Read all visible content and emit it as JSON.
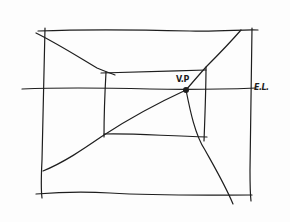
{
  "diagram": {
    "type": "one-point-perspective-sketch",
    "colors": {
      "ink": "#1e1e1e",
      "paper": "#fdfdfd"
    },
    "labels": {
      "vanishing_point": "V.P",
      "eye_level": "E.L."
    },
    "elements": [
      {
        "name": "outer-frame",
        "description": "outer rectangle (picture plane)"
      },
      {
        "name": "inner-frame",
        "description": "inner rectangle (back wall)"
      },
      {
        "name": "eye-level-line",
        "description": "horizontal line through the vanishing point"
      },
      {
        "name": "vanishing-point",
        "description": "dot where diagonals converge"
      },
      {
        "name": "orthogonal-lines",
        "description": "diagonal lines converging to the vanishing point"
      }
    ]
  }
}
